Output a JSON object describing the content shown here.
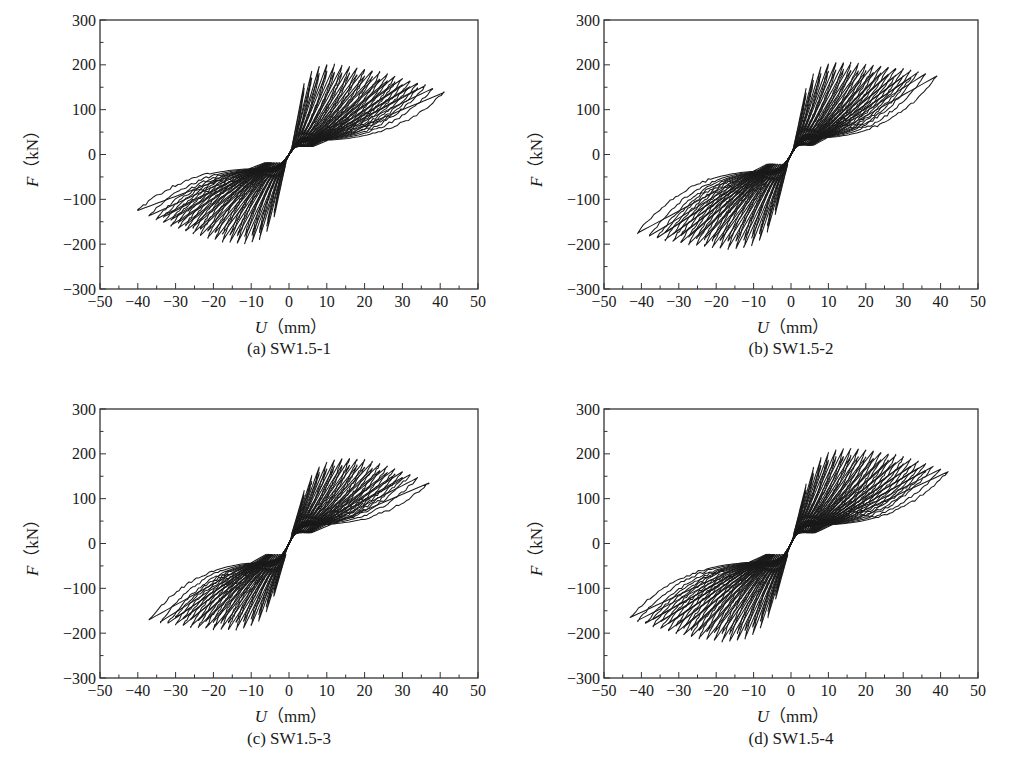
{
  "figure": {
    "axis_common": {
      "xlabel_var": "U",
      "xlabel_unit": "（mm）",
      "ylabel_var": "F",
      "ylabel_unit": "（kN）",
      "xticks": [
        -50,
        -40,
        -30,
        -20,
        -10,
        0,
        10,
        20,
        30,
        40,
        50
      ],
      "yticks": [
        300,
        200,
        100,
        0,
        -100,
        -200,
        -300
      ],
      "xlim": [
        -50,
        50
      ],
      "ylim": [
        -300,
        300
      ],
      "line_color": "#1a1a1a"
    }
  },
  "chart_data": [
    {
      "type": "line",
      "subtype": "hysteresis",
      "title": "(a) SW1.5-1",
      "xlabel": "U（mm）",
      "ylabel": "F（kN）",
      "xlim": [
        -50,
        50
      ],
      "ylim": [
        -300,
        300
      ],
      "xticks": [
        -50,
        -40,
        -30,
        -20,
        -10,
        0,
        10,
        20,
        30,
        40,
        50
      ],
      "yticks": [
        -300,
        -200,
        -100,
        0,
        100,
        200,
        300
      ],
      "grid": false,
      "legend": null,
      "envelope": {
        "positive": {
          "peak_load_kN": 200,
          "disp_at_peak_mm": 10,
          "max_disp_mm": 41,
          "load_at_max_disp_kN": 138,
          "yield_disp_mm": 5
        },
        "negative": {
          "peak_load_kN": -198,
          "disp_at_peak_mm": -12,
          "max_disp_mm": -40,
          "load_at_max_disp_kN": -125,
          "yield_disp_mm": -4
        }
      },
      "cycle_amplitudes_mm": [
        4,
        6,
        8,
        10,
        12,
        14,
        16,
        18,
        20,
        22,
        24,
        26,
        28,
        30,
        32,
        34,
        36,
        38,
        41
      ],
      "pinching_load_kN": 30
    },
    {
      "type": "line",
      "subtype": "hysteresis",
      "title": "(b) SW1.5-2",
      "xlabel": "U（mm）",
      "ylabel": "F（kN）",
      "xlim": [
        -50,
        50
      ],
      "ylim": [
        -300,
        300
      ],
      "xticks": [
        -50,
        -40,
        -30,
        -20,
        -10,
        0,
        10,
        20,
        30,
        40,
        50
      ],
      "yticks": [
        -300,
        -200,
        -100,
        0,
        100,
        200,
        300
      ],
      "grid": false,
      "legend": null,
      "envelope": {
        "positive": {
          "peak_load_kN": 205,
          "disp_at_peak_mm": 12,
          "max_disp_mm": 39,
          "load_at_max_disp_kN": 175,
          "yield_disp_mm": 4
        },
        "negative": {
          "peak_load_kN": -210,
          "disp_at_peak_mm": -15,
          "max_disp_mm": -41,
          "load_at_max_disp_kN": -175,
          "yield_disp_mm": -3
        }
      },
      "cycle_amplitudes_mm": [
        4,
        6,
        8,
        10,
        12,
        14,
        16,
        18,
        20,
        22,
        24,
        26,
        28,
        30,
        32,
        34,
        36,
        39
      ],
      "pinching_load_kN": 35
    },
    {
      "type": "line",
      "subtype": "hysteresis",
      "title": "(c) SW1.5-3",
      "xlabel": "U（mm）",
      "ylabel": "F（kN）",
      "xlim": [
        -50,
        50
      ],
      "ylim": [
        -300,
        300
      ],
      "xticks": [
        -50,
        -40,
        -30,
        -20,
        -10,
        0,
        10,
        20,
        30,
        40,
        50
      ],
      "yticks": [
        -300,
        -200,
        -100,
        0,
        100,
        200,
        300
      ],
      "grid": false,
      "legend": null,
      "envelope": {
        "positive": {
          "peak_load_kN": 190,
          "disp_at_peak_mm": 15,
          "max_disp_mm": 37,
          "load_at_max_disp_kN": 135,
          "yield_disp_mm": 5
        },
        "negative": {
          "peak_load_kN": -192,
          "disp_at_peak_mm": -15,
          "max_disp_mm": -37,
          "load_at_max_disp_kN": -170,
          "yield_disp_mm": -4
        }
      },
      "cycle_amplitudes_mm": [
        4,
        6,
        8,
        10,
        12,
        14,
        16,
        18,
        20,
        22,
        24,
        26,
        28,
        30,
        32,
        34,
        37
      ],
      "pinching_load_kN": 40
    },
    {
      "type": "line",
      "subtype": "hysteresis",
      "title": "(d) SW1.5-4",
      "xlabel": "U（mm）",
      "ylabel": "F（kN）",
      "xlim": [
        -50,
        50
      ],
      "ylim": [
        -300,
        300
      ],
      "xticks": [
        -50,
        -40,
        -30,
        -20,
        -10,
        0,
        10,
        20,
        30,
        40,
        50
      ],
      "yticks": [
        -300,
        -200,
        -100,
        0,
        100,
        200,
        300
      ],
      "grid": false,
      "legend": null,
      "envelope": {
        "positive": {
          "peak_load_kN": 212,
          "disp_at_peak_mm": 15,
          "max_disp_mm": 42,
          "load_at_max_disp_kN": 160,
          "yield_disp_mm": 5
        },
        "negative": {
          "peak_load_kN": -218,
          "disp_at_peak_mm": -17,
          "max_disp_mm": -43,
          "load_at_max_disp_kN": -165,
          "yield_disp_mm": -4
        }
      },
      "cycle_amplitudes_mm": [
        4,
        6,
        8,
        10,
        12,
        14,
        16,
        18,
        20,
        22,
        24,
        26,
        28,
        30,
        32,
        34,
        36,
        38,
        40,
        42
      ],
      "pinching_load_kN": 40
    }
  ],
  "panels": [
    {
      "caption": "(a) SW1.5-1"
    },
    {
      "caption": "(b) SW1.5-2"
    },
    {
      "caption": "(c) SW1.5-3"
    },
    {
      "caption": "(d) SW1.5-4"
    }
  ]
}
